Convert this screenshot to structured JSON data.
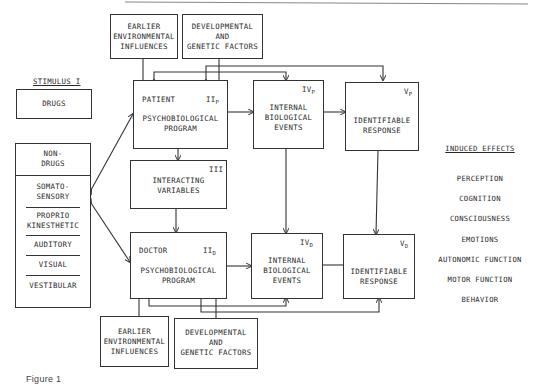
{
  "figure": {
    "top_rule": true,
    "caption_fragment": "Figure 1"
  },
  "stimulus": {
    "heading": "STIMULUS  I",
    "drugs": "DRUGS",
    "non_drugs": "NON-\nDRUGS",
    "modalities": [
      "SOMATO-\nSENSORY",
      "PROPRIO\nKINESTHETIC",
      "AUDITORY",
      "VISUAL",
      "VESTIBULAR"
    ]
  },
  "patient_side": {
    "env": "EARLIER\nENVIRONMENTAL\nINFLUENCES",
    "dev": "DEVELOPMENTAL\nAND\nGENETIC FACTORS",
    "program_role": "PATIENT",
    "program_id": "II",
    "program_sub": "P",
    "program_text": "PSYCHOBIOLOGICAL\nPROGRAM",
    "internal_id": "IV",
    "internal_sub": "P",
    "internal_text": "INTERNAL\nBIOLOGICAL\nEVENTS",
    "response_id": "V",
    "response_sub": "P",
    "response_text": "IDENTIFIABLE\nRESPONSE"
  },
  "interacting": {
    "id": "III",
    "text": "INTERACTING\nVARIABLES"
  },
  "doctor_side": {
    "env": "EARLIER\nENVIRONMENTAL\nINFLUENCES",
    "dev": "DEVELOPMENTAL\nAND\nGENETIC FACTORS",
    "program_role": "DOCTOR",
    "program_id": "II",
    "program_sub": "D",
    "program_text": "PSYCHOBIOLOGICAL\nPROGRAM",
    "internal_id": "IV",
    "internal_sub": "D",
    "internal_text": "INTERNAL\nBIOLOGICAL\nEVENTS",
    "response_id": "V",
    "response_sub": "D",
    "response_text": "IDENTIFIABLE\nRESPONSE"
  },
  "induced_effects": {
    "heading": "INDUCED EFFECTS",
    "items": [
      "PERCEPTION",
      "COGNITION",
      "CONSCIOUSNESS",
      "EMOTIONS",
      "AUTONOMIC FUNCTION",
      "MOTOR FUNCTION",
      "BEHAVIOR"
    ]
  }
}
